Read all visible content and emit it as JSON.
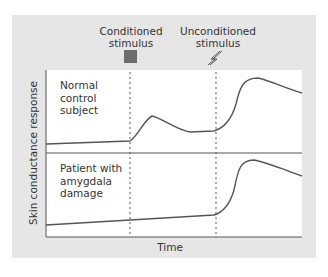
{
  "stimuli": {
    "conditioned": {
      "line1": "Conditioned",
      "line2": "stimulus",
      "icon": "square"
    },
    "unconditioned": {
      "line1": "Unconditioned",
      "line2": "stimulus",
      "icon": "lightning"
    }
  },
  "panels": {
    "top": {
      "line1": "Normal",
      "line2": "control",
      "line3": "subject"
    },
    "bottom": {
      "line1": "Patient with",
      "line2": "amygdala",
      "line3": "damage"
    }
  },
  "axes": {
    "ylabel": "Skin conductance response",
    "xlabel": "Time"
  },
  "colors": {
    "panel_bg": "#e6e6e6",
    "plot_bg": "#ffffff",
    "curve": "#555555",
    "square": "#6d6d6d"
  }
}
